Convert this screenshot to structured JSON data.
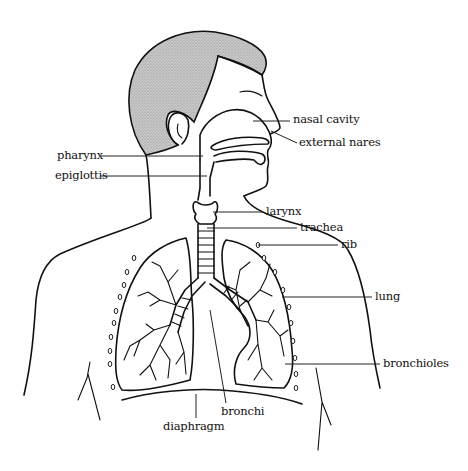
{
  "diagram": {
    "colors": {
      "ink": "#111111",
      "hair": "#9a9a9a",
      "background": "#ffffff"
    },
    "labels": [
      {
        "id": "nasal-cavity",
        "text": "nasal cavity",
        "x": 293,
        "y": 114
      },
      {
        "id": "external-nares",
        "text": "external nares",
        "x": 299,
        "y": 137
      },
      {
        "id": "pharynx",
        "text": "pharynx",
        "x": 57,
        "y": 151
      },
      {
        "id": "epiglottis",
        "text": "epiglottis",
        "x": 55,
        "y": 171
      },
      {
        "id": "larynx",
        "text": "larynx",
        "x": 266,
        "y": 206
      },
      {
        "id": "trachea",
        "text": "trachea",
        "x": 300,
        "y": 222
      },
      {
        "id": "rib",
        "text": "rib",
        "x": 341,
        "y": 238
      },
      {
        "id": "lung",
        "text": "lung",
        "x": 375,
        "y": 291
      },
      {
        "id": "bronchioles",
        "text": "bronchioles",
        "x": 383,
        "y": 358
      },
      {
        "id": "bronchi",
        "text": "bronchi",
        "x": 221,
        "y": 407
      },
      {
        "id": "diaphragm",
        "text": "diaphragm",
        "x": 163,
        "y": 422
      }
    ]
  }
}
